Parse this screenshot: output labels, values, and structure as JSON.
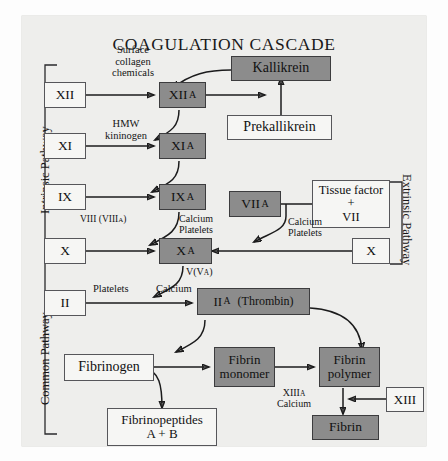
{
  "title": "COAGULATION CASCADE",
  "pathways": {
    "intrinsic": "Intrinsic Pathway",
    "extrinsic": "Extrinsic Pathway",
    "common": "Common Pathway"
  },
  "nodes": {
    "f12": {
      "label": "XII",
      "style": "white"
    },
    "f12a_main": {
      "label": "XII",
      "sub": "A",
      "style": "gray"
    },
    "kallikrein": {
      "label": "Kallikrein",
      "style": "gray"
    },
    "prekallikrein": {
      "label": "Prekallikrein",
      "style": "white"
    },
    "f11": {
      "label": "XI",
      "style": "white"
    },
    "f11a_main": {
      "label": "XI",
      "sub": "A",
      "style": "gray"
    },
    "f9": {
      "label": "IX",
      "style": "white"
    },
    "f9a_main": {
      "label": "IX",
      "sub": "A",
      "style": "gray"
    },
    "f7a_main": {
      "label": "VII",
      "sub": "A",
      "style": "gray"
    },
    "tissue_factor": {
      "line1": "Tissue factor",
      "line2": "+",
      "line3": "VII",
      "style": "white"
    },
    "f10_left": {
      "label": "X",
      "style": "white"
    },
    "f10_right": {
      "label": "X",
      "style": "white"
    },
    "f10a_main": {
      "label": "X",
      "sub": "A",
      "style": "gray"
    },
    "f2": {
      "label": "II",
      "style": "white"
    },
    "f2a_main": {
      "label": "II",
      "sub": "A",
      "suffix": "(Thrombin)",
      "style": "gray"
    },
    "fibrinogen": {
      "label": "Fibrinogen",
      "style": "white"
    },
    "fibrin_monomer": {
      "line1": "Fibrin",
      "line2": "monomer",
      "style": "gray"
    },
    "fibrin_polymer": {
      "line1": "Fibrin",
      "line2": "polymer",
      "style": "gray"
    },
    "fibrinopeptides": {
      "line1": "Fibrinopeptides",
      "line2": "A + B",
      "style": "white"
    },
    "fibrin": {
      "label": "Fibrin",
      "style": "gray"
    },
    "f13": {
      "label": "XIII",
      "style": "white"
    }
  },
  "notes": {
    "surface": {
      "line1": "Surface",
      "line2": "collagen",
      "line3": "chemicals"
    },
    "hmw": {
      "line1": "HMW",
      "line2": "kininogen"
    },
    "viii": {
      "text": "VIII (VIII",
      "sub": "A",
      "tail": ")"
    },
    "calcium_platelets_left": {
      "line1": "Calcium",
      "line2": "Platelets"
    },
    "calcium_platelets_right": {
      "line1": "Calcium",
      "line2": "Platelets"
    },
    "v_va": {
      "text": "V(V",
      "sub": "A",
      "tail": ")"
    },
    "platelets": {
      "text": "Platelets"
    },
    "calcium": {
      "text": "Calcium"
    },
    "xiiia_calcium": {
      "line1": "XIII",
      "sub": "A",
      "line2": "Calcium"
    }
  },
  "colors": {
    "plate_bg": "#eeeeec",
    "gray_node": "#8c8c8c",
    "white_node": "#f6f6f4",
    "stroke": "#1b1b1c",
    "text": "#101011"
  }
}
